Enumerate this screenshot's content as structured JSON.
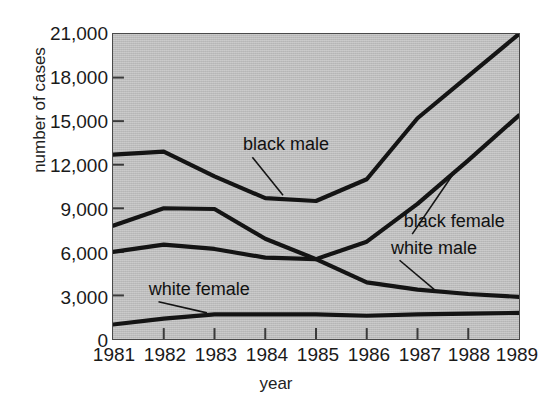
{
  "chart_data": {
    "type": "line",
    "title": "",
    "xlabel": "year",
    "ylabel": "number of cases",
    "x": [
      1981,
      1982,
      1983,
      1984,
      1985,
      1986,
      1987,
      1988,
      1989
    ],
    "categories": [
      "1981",
      "1982",
      "1983",
      "1984",
      "1985",
      "1986",
      "1987",
      "1988",
      "1989"
    ],
    "xlim": [
      1981,
      1989
    ],
    "ylim": [
      0,
      21000
    ],
    "y_ticks": [
      0,
      3000,
      6000,
      9000,
      12000,
      15000,
      18000,
      21000
    ],
    "y_tick_labels": [
      "0",
      "3,000",
      "6,000",
      "9,000",
      "12,000",
      "15,000",
      "18,000",
      "21,000"
    ],
    "grid": false,
    "legend_position": "inline-annotations",
    "plot_background_color": "#bcbcbc",
    "line_color": "#141414",
    "series": [
      {
        "name": "black male",
        "values": [
          12700,
          12900,
          11200,
          9700,
          9500,
          11000,
          15200,
          18100,
          21000
        ]
      },
      {
        "name": "black female",
        "values": [
          6000,
          6500,
          6200,
          5600,
          5500,
          6700,
          9300,
          12300,
          15400
        ]
      },
      {
        "name": "white male",
        "values": [
          7800,
          9000,
          8950,
          6900,
          5500,
          3900,
          3400,
          3100,
          2900
        ]
      },
      {
        "name": "white female",
        "values": [
          1000,
          1400,
          1700,
          1700,
          1700,
          1600,
          1700,
          1750,
          1800
        ]
      }
    ],
    "annotations": [
      {
        "label": "black male",
        "label_x": 1983.55,
        "label_y": 13000,
        "point_x": 1984.35,
        "point_y": 9900
      },
      {
        "label": "black female",
        "label_x": 1986.7,
        "label_y": 7700,
        "point_x": 1987.75,
        "point_y": 11600
      },
      {
        "label": "white male",
        "label_x": 1986.45,
        "label_y": 5900,
        "point_x": 1987.35,
        "point_y": 3350
      },
      {
        "label": "white female",
        "label_x": 1981.7,
        "label_y": 3050,
        "point_x": 1982.85,
        "point_y": 1800
      }
    ]
  }
}
